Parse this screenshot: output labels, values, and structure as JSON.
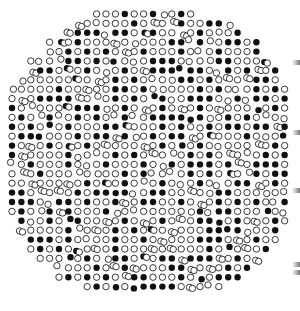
{
  "figure": {
    "grid": {
      "cols": 30,
      "rows": 30,
      "spacing": 9.4,
      "origin_x": 12,
      "origin_y": 14,
      "dot_radius": 3.2
    },
    "colors": {
      "filled": "#111111",
      "open_stroke": "#222222",
      "background": "#ffffff"
    },
    "legend": {
      "filled": "filled-circle",
      "open": "open-circle"
    },
    "edge_marks_y": [
      60,
      130,
      188,
      262,
      270
    ]
  }
}
